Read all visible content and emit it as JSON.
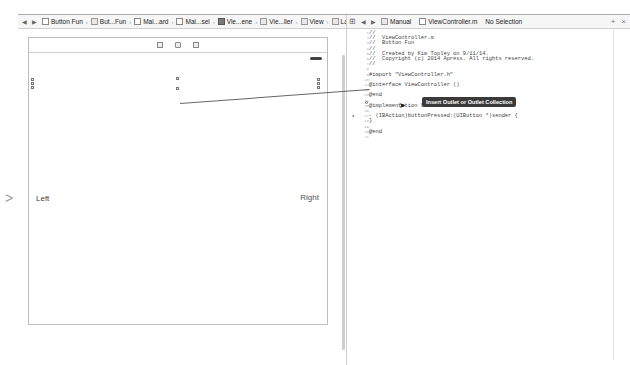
{
  "jumpbar_left": {
    "back": "◀",
    "forward": "▶",
    "crumbs": [
      {
        "label": "Button Fun",
        "icon": "project-icon"
      },
      {
        "label": "But...Fun",
        "icon": "folder-icon"
      },
      {
        "label": "Mai...ard",
        "icon": "storyboard-file-icon"
      },
      {
        "label": "Mai...sel",
        "icon": "storyboard-file-icon"
      },
      {
        "label": "Vie...ene",
        "icon": "scene-icon"
      },
      {
        "label": "Vie...ller",
        "icon": "view-controller-icon"
      },
      {
        "label": "View",
        "icon": "view-icon"
      },
      {
        "label": "Label",
        "icon": "label-icon"
      }
    ]
  },
  "jumpbar_right": {
    "related_icon": "⊞",
    "back": "◀",
    "forward": "▶",
    "mode": "Manual",
    "file": "ViewController.m",
    "selection": "No Selection",
    "add": "+",
    "close": "×"
  },
  "canvas": {
    "label_left": "Left",
    "label_right": "Right",
    "entry_arrow": ">"
  },
  "editor": {
    "line_numbers": [
      "1",
      "2",
      "3",
      "4",
      "5",
      "6",
      "7",
      "8",
      "9",
      "10",
      "11",
      "12",
      "13",
      "14",
      "15",
      "16",
      "17",
      "18",
      "19",
      "20",
      "21"
    ],
    "lines": [
      "//",
      "//  ViewController.m",
      "//  Button Fun",
      "//",
      "//  Created by Kim Topley on 9/11/14.",
      "//  Copyright (c) 2014 Apress. All rights reserved.",
      "//",
      "",
      "#import \"ViewController.h\"",
      "",
      "@interface ViewController ()",
      "",
      "@end",
      "",
      "@implementation ViewController",
      "",
      "- (IBAction)buttonPressed:(UIButton *)sender {",
      "}",
      "",
      "@end",
      ""
    ]
  },
  "tooltip": "Insert Outlet or Outlet Collection"
}
